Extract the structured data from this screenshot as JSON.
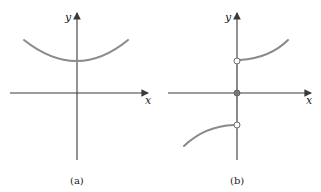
{
  "panels": [
    {
      "id": "a",
      "caption": "(a)",
      "x_label": "x",
      "y_label": "y",
      "description": "Continuous U-shaped curve above the x-axis, minimum on the y-axis",
      "curve_color": "#8a8a8a"
    },
    {
      "id": "b",
      "caption": "(b)",
      "x_label": "x",
      "y_label": "y",
      "description": "Discontinuous function: upper branch for x>0 with open circle at y-axis, lower branch for x<0 with open circle at y-axis, filled point at the origin",
      "curve_color": "#8a8a8a",
      "open_points": [
        "upper-right-branch-start",
        "lower-left-branch-end"
      ],
      "filled_points": [
        "origin"
      ]
    }
  ]
}
